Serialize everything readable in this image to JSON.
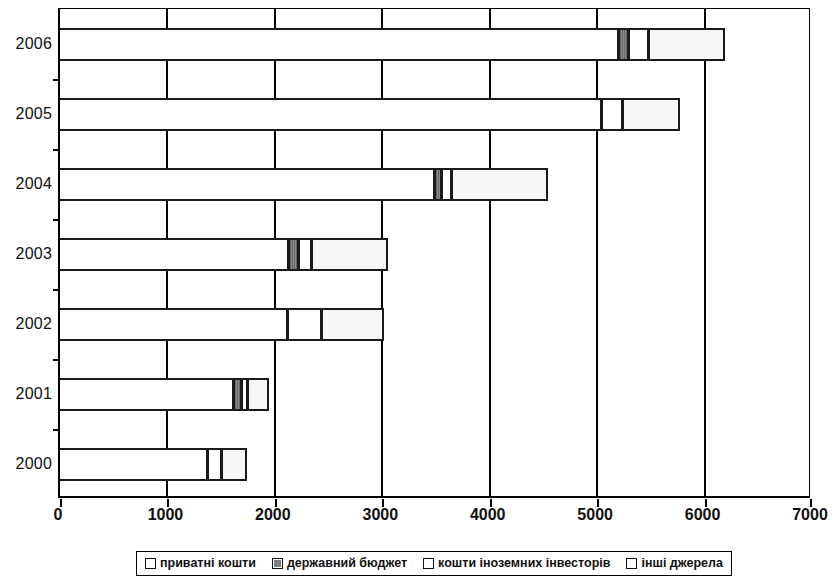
{
  "chart_data": {
    "type": "bar",
    "orientation": "horizontal",
    "stacked": true,
    "title": "",
    "subtitle": "",
    "xlabel": "",
    "ylabel": "",
    "categories": [
      "2006",
      "2005",
      "2004",
      "2003",
      "2002",
      "2001",
      "2000"
    ],
    "xlim": [
      0,
      7000
    ],
    "xticks": [
      0,
      1000,
      2000,
      3000,
      4000,
      5000,
      6000,
      7000
    ],
    "xtick_labels": [
      "0",
      "1000",
      "2000",
      "3000",
      "4000",
      "5000",
      "6000",
      "7000"
    ],
    "grid": true,
    "grid_axis": "x",
    "legend_position": "bottom",
    "series": [
      {
        "name": "приватні кошти",
        "key": "private",
        "color": "#ffffff",
        "pattern": "solid-white",
        "values": [
          5203,
          5045,
          3491,
          2132,
          2122,
          1620,
          1378
        ]
      },
      {
        "name": "державний бюджет",
        "key": "budget",
        "color": "#7d7d7d",
        "pattern": "dark-gray",
        "values": [
          93,
          0,
          65,
          93,
          0,
          74,
          0
        ]
      },
      {
        "name": "кошти іноземних інвесторів",
        "key": "foreign",
        "color": "#ffffff",
        "pattern": "solid-white",
        "values": [
          186,
          195,
          93,
          121,
          317,
          56,
          130
        ]
      },
      {
        "name": "інші джерела",
        "key": "other",
        "color": "#f7f7f7",
        "pattern": "light-white",
        "values": [
          708,
          530,
          893,
          708,
          577,
          195,
          233
        ]
      }
    ],
    "totals": [
      6190,
      5770,
      4542,
      3054,
      3016,
      1945,
      1741
    ],
    "cumulative": [
      [
        5203,
        5296,
        5482,
        6190
      ],
      [
        5045,
        5045,
        5240,
        5770
      ],
      [
        3491,
        3556,
        3649,
        4542
      ],
      [
        2132,
        2225,
        2346,
        3054
      ],
      [
        2122,
        2122,
        2439,
        3016
      ],
      [
        1620,
        1694,
        1750,
        1945
      ],
      [
        1378,
        1378,
        1508,
        1741
      ]
    ]
  },
  "legend": {
    "items": [
      {
        "label": "приватні кошти",
        "swatch": "white"
      },
      {
        "label": "державний бюджет",
        "swatch": "gray"
      },
      {
        "label": "кошти іноземних інвесторів",
        "swatch": "white"
      },
      {
        "label": "інші джерела",
        "swatch": "white"
      }
    ]
  }
}
